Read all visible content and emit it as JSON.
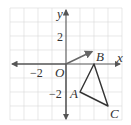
{
  "diagram": {
    "type": "coordinate-plane",
    "axes": {
      "x_label": "x",
      "y_label": "y",
      "origin_label": "O"
    },
    "ticks": {
      "x_neg": "−2",
      "y_pos": "2",
      "y_neg": "−2"
    },
    "points": [
      {
        "name": "A",
        "x": 1,
        "y": -2
      },
      {
        "name": "B",
        "x": 2,
        "y": 0
      },
      {
        "name": "C",
        "x": 3,
        "y": -3
      }
    ],
    "vector": {
      "from": [
        0,
        0
      ],
      "to": [
        2,
        1
      ]
    },
    "colors": {
      "grid": "#d9d9d9",
      "axis": "#555555",
      "triangle": "#333333",
      "vector": "#666666"
    }
  }
}
